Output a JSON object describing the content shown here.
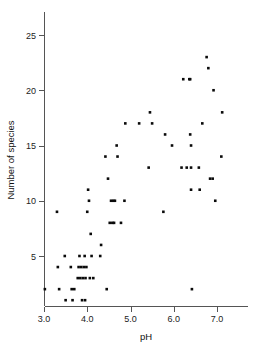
{
  "chart_data": {
    "type": "scatter",
    "title": "",
    "xlabel": "pH",
    "ylabel": "Number of species",
    "xlim": [
      2.85,
      7.5
    ],
    "ylim": [
      0.2,
      26.5
    ],
    "grid": false,
    "legend": null,
    "xticks": [
      3.0,
      4.0,
      5.0,
      6.0,
      7.0
    ],
    "xticklabels": [
      "3.0",
      "4.0",
      "5.0",
      "6.0",
      "7.0"
    ],
    "yticks": [
      5,
      10,
      15,
      20,
      25
    ],
    "yticklabels": [
      "5",
      "10",
      "15",
      "20",
      "25"
    ],
    "marker": "filled-square",
    "marker_color": "#0a0a0a",
    "points": [
      {
        "x": 3.02,
        "y": 2
      },
      {
        "x": 3.3,
        "y": 9
      },
      {
        "x": 3.32,
        "y": 4
      },
      {
        "x": 3.35,
        "y": 2
      },
      {
        "x": 3.48,
        "y": 5
      },
      {
        "x": 3.5,
        "y": 1
      },
      {
        "x": 3.62,
        "y": 4
      },
      {
        "x": 3.64,
        "y": 2
      },
      {
        "x": 3.66,
        "y": 1
      },
      {
        "x": 3.7,
        "y": 2
      },
      {
        "x": 3.78,
        "y": 3
      },
      {
        "x": 3.8,
        "y": 4
      },
      {
        "x": 3.82,
        "y": 5
      },
      {
        "x": 3.84,
        "y": 3
      },
      {
        "x": 3.86,
        "y": 4
      },
      {
        "x": 3.88,
        "y": 1
      },
      {
        "x": 3.9,
        "y": 3
      },
      {
        "x": 3.92,
        "y": 4
      },
      {
        "x": 3.94,
        "y": 5
      },
      {
        "x": 3.95,
        "y": 1
      },
      {
        "x": 3.96,
        "y": 3
      },
      {
        "x": 3.98,
        "y": 4
      },
      {
        "x": 4.0,
        "y": 9
      },
      {
        "x": 4.02,
        "y": 11
      },
      {
        "x": 4.04,
        "y": 10
      },
      {
        "x": 4.06,
        "y": 3
      },
      {
        "x": 4.08,
        "y": 7
      },
      {
        "x": 4.1,
        "y": 5
      },
      {
        "x": 4.14,
        "y": 3
      },
      {
        "x": 4.3,
        "y": 5
      },
      {
        "x": 4.32,
        "y": 6
      },
      {
        "x": 4.42,
        "y": 14
      },
      {
        "x": 4.45,
        "y": 2
      },
      {
        "x": 4.48,
        "y": 12
      },
      {
        "x": 4.52,
        "y": 8
      },
      {
        "x": 4.55,
        "y": 10
      },
      {
        "x": 4.58,
        "y": 8
      },
      {
        "x": 4.6,
        "y": 10
      },
      {
        "x": 4.62,
        "y": 8
      },
      {
        "x": 4.64,
        "y": 10
      },
      {
        "x": 4.68,
        "y": 15
      },
      {
        "x": 4.7,
        "y": 14
      },
      {
        "x": 4.78,
        "y": 8
      },
      {
        "x": 4.86,
        "y": 10
      },
      {
        "x": 4.88,
        "y": 17
      },
      {
        "x": 5.2,
        "y": 17
      },
      {
        "x": 5.42,
        "y": 13
      },
      {
        "x": 5.45,
        "y": 18
      },
      {
        "x": 5.5,
        "y": 17
      },
      {
        "x": 5.76,
        "y": 9
      },
      {
        "x": 5.8,
        "y": 16
      },
      {
        "x": 5.96,
        "y": 15
      },
      {
        "x": 6.18,
        "y": 13
      },
      {
        "x": 6.22,
        "y": 21
      },
      {
        "x": 6.3,
        "y": 13
      },
      {
        "x": 6.36,
        "y": 21
      },
      {
        "x": 6.38,
        "y": 21
      },
      {
        "x": 6.38,
        "y": 16
      },
      {
        "x": 6.4,
        "y": 15
      },
      {
        "x": 6.4,
        "y": 13
      },
      {
        "x": 6.4,
        "y": 11
      },
      {
        "x": 6.42,
        "y": 2
      },
      {
        "x": 6.58,
        "y": 13
      },
      {
        "x": 6.6,
        "y": 11
      },
      {
        "x": 6.66,
        "y": 17
      },
      {
        "x": 6.76,
        "y": 23
      },
      {
        "x": 6.8,
        "y": 22
      },
      {
        "x": 6.84,
        "y": 12
      },
      {
        "x": 6.9,
        "y": 12
      },
      {
        "x": 6.92,
        "y": 20
      },
      {
        "x": 6.96,
        "y": 10
      },
      {
        "x": 7.1,
        "y": 14
      },
      {
        "x": 7.12,
        "y": 18
      }
    ]
  },
  "axes": {
    "x_title": "pH",
    "y_title": "Number of species"
  }
}
